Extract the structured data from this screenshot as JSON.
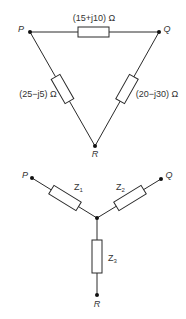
{
  "delta_network": {
    "nodes": {
      "P": {
        "label": "P"
      },
      "Q": {
        "label": "Q"
      },
      "R": {
        "label": "R"
      }
    },
    "impedances": {
      "PQ": {
        "label": "(15+j10) Ω"
      },
      "PR": {
        "label": "(25−j5) Ω"
      },
      "QR": {
        "label": "(20−j30) Ω"
      }
    }
  },
  "star_network": {
    "nodes": {
      "P": {
        "label": "P"
      },
      "Q": {
        "label": "Q"
      },
      "R": {
        "label": "R"
      }
    },
    "impedances": {
      "Z1": {
        "main": "Z",
        "sub": "1"
      },
      "Z2": {
        "main": "Z",
        "sub": "2"
      },
      "Z3": {
        "main": "Z",
        "sub": "3"
      }
    }
  }
}
